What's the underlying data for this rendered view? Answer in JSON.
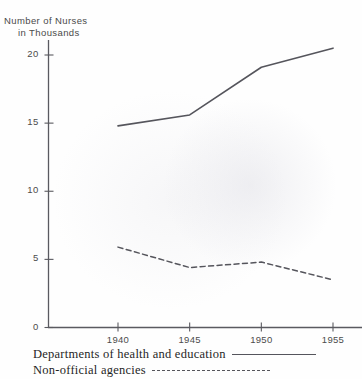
{
  "chart_data": {
    "type": "line",
    "title": "Number of Nurses in Thousands",
    "title_line1": "Number of Nurses",
    "title_line2": "in Thousands",
    "xlabel": "",
    "ylabel": "Number of Nurses in Thousands",
    "x": [
      1940,
      1945,
      1950,
      1955
    ],
    "categories": [
      "1940",
      "1945",
      "1950",
      "1955"
    ],
    "xtick_labels": [
      "1940",
      "1945",
      "1950",
      "1955"
    ],
    "ytick_labels": [
      "0",
      "5",
      "10",
      "15",
      "20"
    ],
    "ytick_values": [
      0,
      5,
      10,
      15,
      20
    ],
    "xlim": [
      1938.5,
      1956.5
    ],
    "ylim": [
      0,
      22
    ],
    "grid": false,
    "legend_position": "below-axes",
    "series": [
      {
        "name": "Departments of health and education",
        "style": "solid",
        "color": "#55555c",
        "values": [
          14.8,
          15.6,
          19.1,
          20.5
        ]
      },
      {
        "name": "Non-official agencies",
        "style": "dashed",
        "color": "#55555c",
        "values": [
          5.9,
          4.4,
          4.8,
          3.5
        ]
      }
    ]
  },
  "legend": {
    "rows": [
      {
        "label": "Departments of health and education",
        "style": "solid"
      },
      {
        "label": "Non-official agencies",
        "style": "dashed"
      }
    ]
  }
}
